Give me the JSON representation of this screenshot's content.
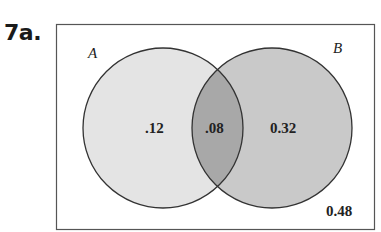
{
  "problem": {
    "label": "7a."
  },
  "venn": {
    "sets": [
      {
        "name": "A",
        "fill": "#e4e4e4"
      },
      {
        "name": "B",
        "fill": "#c9c9c9"
      }
    ],
    "intersection_fill": "#a8a8a8",
    "values": {
      "a_only": ".12",
      "a_and_b": ".08",
      "b_only": "0.32",
      "neither": "0.48"
    }
  }
}
